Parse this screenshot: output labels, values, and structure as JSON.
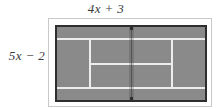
{
  "figure": {
    "type": "tennis-court-diagram",
    "top_dimension_label": "4x + 3",
    "left_dimension_label": "5x − 2",
    "colors": {
      "court_surface": "#8a8a8a",
      "court_lines": "#ededed",
      "court_border": "#2e2e2e",
      "outer_frame": "#c9c9c9",
      "label_text": "#3a3a3a",
      "page_background": "#ffffff"
    },
    "court_markings": [
      "doubles-alley-line-top",
      "doubles-alley-line-bottom",
      "singles-sideline-left",
      "singles-sideline-right",
      "center-service-line",
      "net"
    ]
  }
}
